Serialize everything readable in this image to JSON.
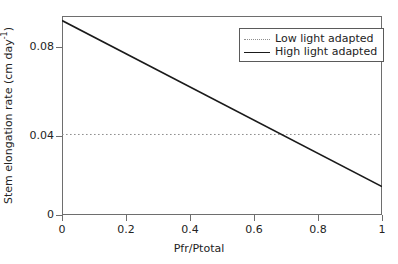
{
  "chart_data": {
    "type": "line",
    "title": "",
    "xlabel": "Pfr/Ptotal",
    "ylabel": "Stem elongation rate (cm day⁻¹)",
    "ylabel_text": "Stem elongation rate (cm day",
    "ylabel_sup": "-1",
    "ylabel_tail": ")",
    "xlim": [
      0,
      1
    ],
    "ylim": [
      0,
      0.0897
    ],
    "grid": false,
    "legend_position": "top-right",
    "xticks": [
      0,
      0.2,
      0.4,
      0.6,
      0.8,
      1
    ],
    "xtick_labels": [
      "0",
      "0.2",
      "0.4",
      "0.6",
      "0.8",
      "1"
    ],
    "yticks": [
      0,
      0.04,
      0.08
    ],
    "ytick_labels": [
      "0",
      "0.04",
      "0.08"
    ],
    "series": [
      {
        "name": "Low light adapted",
        "style": "dotted",
        "color": "#8e8e8e",
        "x": [
          0,
          1
        ],
        "values": [
          0.0363,
          0.0363
        ]
      },
      {
        "name": "High light adapted",
        "style": "solid",
        "color": "#1a1a1a",
        "x": [
          0,
          1
        ],
        "values": [
          0.0877,
          0.0128
        ]
      }
    ],
    "annotations": []
  },
  "legend": {
    "items": [
      {
        "label": "Low light adapted",
        "style": "dotted"
      },
      {
        "label": "High light adapted",
        "style": "solid"
      }
    ]
  },
  "colors": {
    "background": "#ffffff",
    "axis": "#6e6e6e",
    "text": "#232323",
    "high_light_line": "#1a1a1a",
    "low_light_line": "#8e8e8e",
    "legend_border": "#5a5a5a"
  }
}
